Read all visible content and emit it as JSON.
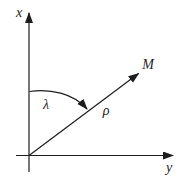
{
  "diagram": {
    "labels": {
      "vertical_axis": "x",
      "horizontal_axis": "y",
      "point": "M",
      "angle": "λ",
      "radius": "ρ"
    },
    "colors": {
      "line": "#1d1d1d",
      "background": "#ffffff"
    }
  }
}
